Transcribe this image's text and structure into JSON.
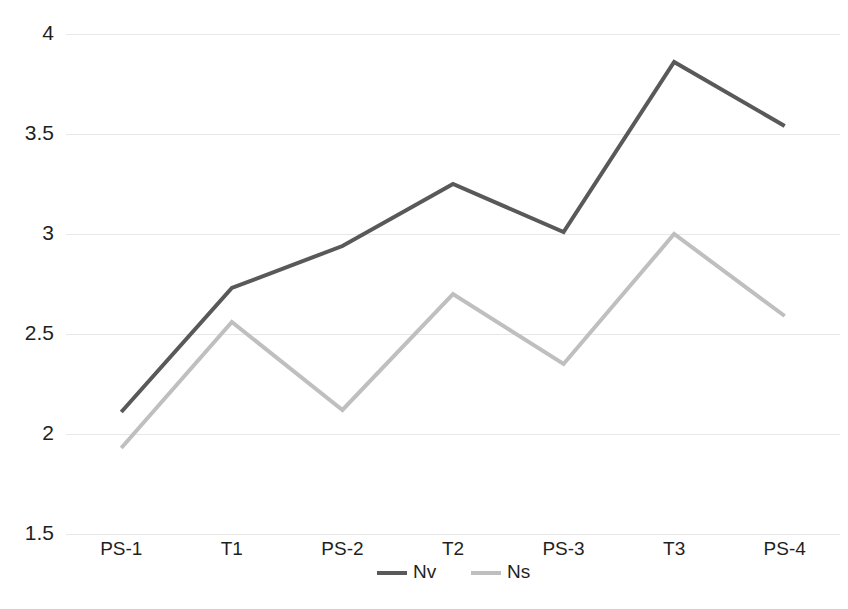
{
  "chart_data": {
    "type": "line",
    "title": "",
    "subtitle": "",
    "xlabel": "",
    "ylabel": "",
    "categories": [
      "PS-1",
      "T1",
      "PS-2",
      "T2",
      "PS-3",
      "T3",
      "PS-4"
    ],
    "series": [
      {
        "name": "Nv",
        "color": "#595959",
        "values": [
          2.11,
          2.73,
          2.94,
          3.25,
          3.01,
          3.86,
          3.54
        ]
      },
      {
        "name": "Ns",
        "color": "#bfbfbf",
        "values": [
          1.93,
          2.56,
          2.12,
          2.7,
          2.35,
          3.0,
          2.59
        ]
      }
    ],
    "ylim": [
      1.5,
      4.0
    ],
    "yticks": [
      "1.5",
      "2",
      "2.5",
      "3",
      "3.5",
      "4"
    ],
    "ytick_values": [
      1.5,
      2,
      2.5,
      3,
      3.5,
      4
    ],
    "grid": true,
    "grid_color": "#e8e8e8",
    "legend_position": "bottom",
    "background": "#ffffff"
  },
  "axes": {
    "y_axis_name": "value-axis",
    "x_axis_name": "category-axis"
  },
  "legend": {
    "entries": [
      {
        "label": "Nv",
        "color": "#595959"
      },
      {
        "label": "Ns",
        "color": "#bfbfbf"
      }
    ]
  }
}
